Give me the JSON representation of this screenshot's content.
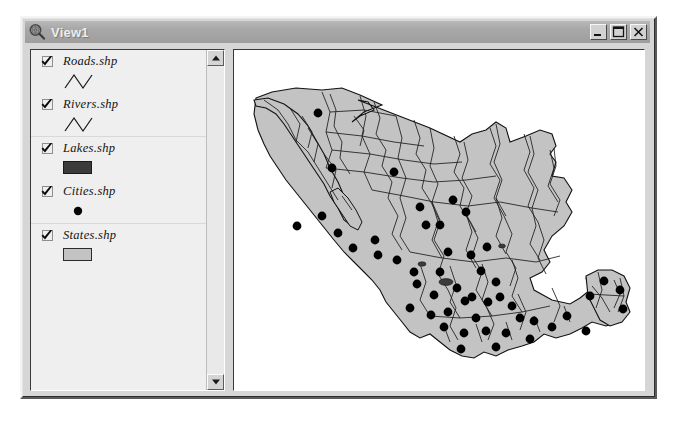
{
  "window": {
    "title": "View1",
    "icon": "magnifier-globe-icon",
    "buttons": {
      "minimize": "_",
      "maximize": "□",
      "close": "×"
    }
  },
  "legend": {
    "groups": [
      {
        "items": [
          {
            "label": "Roads.shp",
            "checked": true,
            "symbol": "zigzag-line"
          },
          {
            "label": "Rivers.shp",
            "checked": true,
            "symbol": "zigzag-line"
          }
        ]
      },
      {
        "items": [
          {
            "label": "Lakes.shp",
            "checked": true,
            "symbol": "filled-rect-dark"
          },
          {
            "label": "Cities.shp",
            "checked": true,
            "symbol": "filled-dot"
          }
        ]
      },
      {
        "items": [
          {
            "label": "States.shp",
            "checked": true,
            "symbol": "filled-rect-light"
          }
        ]
      }
    ],
    "scrollbar": {
      "up_arrow": "scroll-up-arrow",
      "down_arrow": "scroll-down-arrow"
    }
  },
  "colors": {
    "titlebar": "#a8a8a8",
    "title_text": "#ededed",
    "window_face": "#d6d6d6",
    "legend_bg": "#efefef",
    "map_bg": "#ffffff",
    "state_fill": "#c3c3c3",
    "state_border": "#1a1a1a",
    "lake_fill": "#3b3b3b",
    "city_dot": "#000000",
    "river_line": "#2a2a2a"
  },
  "map": {
    "region": "Mexico",
    "layers": [
      "States",
      "Rivers",
      "Roads",
      "Lakes",
      "Cities"
    ],
    "state_fill": "#c3c3c3",
    "outline_color": "#111111",
    "city_dot_color": "#000000",
    "city_dots": [
      [
        84,
        63
      ],
      [
        98,
        118
      ],
      [
        160,
        122
      ],
      [
        141,
        190
      ],
      [
        104,
        183
      ],
      [
        63,
        176
      ],
      [
        88,
        166
      ],
      [
        186,
        157
      ],
      [
        192,
        175
      ],
      [
        219,
        150
      ],
      [
        232,
        162
      ],
      [
        214,
        202
      ],
      [
        237,
        205
      ],
      [
        163,
        210
      ],
      [
        180,
        222
      ],
      [
        206,
        222
      ],
      [
        253,
        197
      ],
      [
        223,
        238
      ],
      [
        238,
        247
      ],
      [
        254,
        252
      ],
      [
        200,
        245
      ],
      [
        183,
        234
      ],
      [
        176,
        258
      ],
      [
        197,
        265
      ],
      [
        214,
        262
      ],
      [
        242,
        268
      ],
      [
        266,
        247
      ],
      [
        262,
        232
      ],
      [
        278,
        256
      ],
      [
        286,
        268
      ],
      [
        230,
        283
      ],
      [
        252,
        281
      ],
      [
        272,
        283
      ],
      [
        300,
        271
      ],
      [
        318,
        277
      ],
      [
        333,
        266
      ],
      [
        352,
        281
      ],
      [
        370,
        231
      ],
      [
        356,
        246
      ],
      [
        386,
        240
      ],
      [
        389,
        259
      ],
      [
        227,
        299
      ],
      [
        262,
        297
      ],
      [
        144,
        205
      ],
      [
        119,
        198
      ],
      [
        206,
        175
      ],
      [
        247,
        221
      ],
      [
        231,
        251
      ],
      [
        210,
        277
      ],
      [
        296,
        289
      ]
    ]
  }
}
